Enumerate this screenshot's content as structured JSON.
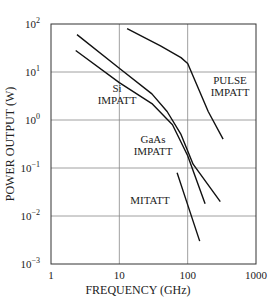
{
  "chart_data": {
    "type": "line",
    "title": "",
    "xlabel": "FREQUENCY (GHz)",
    "ylabel": "POWER OUTPUT (W)",
    "xscale": "log",
    "yscale": "log",
    "xlim": [
      1,
      1000
    ],
    "ylim": [
      0.001,
      100
    ],
    "grid": true,
    "x_ticks": [
      {
        "value": 1,
        "label": "1"
      },
      {
        "value": 10,
        "label": "10"
      },
      {
        "value": 100,
        "label": "100"
      },
      {
        "value": 1000,
        "label": "1000"
      }
    ],
    "y_ticks": [
      {
        "value": 100,
        "base": "10",
        "exp": "2"
      },
      {
        "value": 10,
        "base": "10",
        "exp": "1"
      },
      {
        "value": 1,
        "base": "10",
        "exp": "0"
      },
      {
        "value": 0.1,
        "base": "10",
        "exp": "−1"
      },
      {
        "value": 0.01,
        "base": "10",
        "exp": "−2"
      },
      {
        "value": 0.001,
        "base": "10",
        "exp": "−3"
      }
    ],
    "series": [
      {
        "name": "Si IMPATT",
        "label_lines": [
          "Si",
          "IMPATT"
        ],
        "points": [
          [
            2.4,
            60
          ],
          [
            10,
            12
          ],
          [
            30,
            3.5
          ],
          [
            50,
            1.5
          ],
          [
            80,
            0.5
          ],
          [
            120,
            0.12
          ],
          [
            300,
            0.02
          ]
        ]
      },
      {
        "name": "GaAs IMPATT",
        "label_lines": [
          "GaAs",
          "IMPATT"
        ],
        "points": [
          [
            2.3,
            28
          ],
          [
            10,
            6
          ],
          [
            30,
            2.2
          ],
          [
            60,
            0.8
          ],
          [
            100,
            0.18
          ],
          [
            180,
            0.018
          ]
        ]
      },
      {
        "name": "PULSE IMPATT",
        "label_lines": [
          "PULSE",
          "IMPATT"
        ],
        "points": [
          [
            13,
            80
          ],
          [
            40,
            35
          ],
          [
            80,
            20
          ],
          [
            100,
            15
          ],
          [
            200,
            1.5
          ],
          [
            330,
            0.4
          ]
        ]
      },
      {
        "name": "MITATT",
        "label_lines": [
          "MITATT"
        ],
        "points": [
          [
            70,
            0.08
          ],
          [
            100,
            0.017
          ],
          [
            150,
            0.003
          ]
        ]
      }
    ]
  }
}
